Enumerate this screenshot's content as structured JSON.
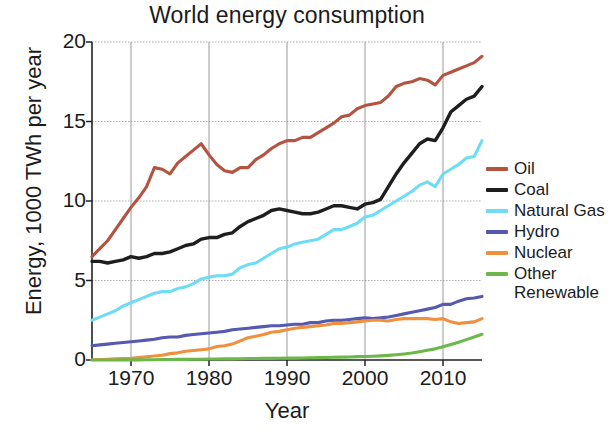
{
  "chart_data": {
    "type": "line",
    "title": "World energy consumption",
    "xlabel": "Year",
    "ylabel": "Energy, 1000 TWh per year",
    "xlim": [
      1965,
      2015
    ],
    "ylim": [
      0,
      20
    ],
    "xticks": [
      1970,
      1980,
      1990,
      2000,
      2010
    ],
    "xtick_labels": [
      "1970",
      "1980",
      "1990",
      "2000",
      "2010"
    ],
    "yticks": [
      0,
      5,
      10,
      15,
      20
    ],
    "ytick_labels": [
      "0",
      "5",
      "10",
      "15",
      "20"
    ],
    "grid": true,
    "legend_position": "right",
    "x": [
      1965,
      1966,
      1967,
      1968,
      1969,
      1970,
      1971,
      1972,
      1973,
      1974,
      1975,
      1976,
      1977,
      1978,
      1979,
      1980,
      1981,
      1982,
      1983,
      1984,
      1985,
      1986,
      1987,
      1988,
      1989,
      1990,
      1991,
      1992,
      1993,
      1994,
      1995,
      1996,
      1997,
      1998,
      1999,
      2000,
      2001,
      2002,
      2003,
      2004,
      2005,
      2006,
      2007,
      2008,
      2009,
      2010,
      2011,
      2012,
      2013,
      2014,
      2015
    ],
    "series": [
      {
        "name": "Oil",
        "color": "#b35340",
        "values": [
          6.5,
          7.0,
          7.5,
          8.2,
          8.9,
          9.6,
          10.2,
          10.9,
          12.1,
          12.0,
          11.7,
          12.4,
          12.8,
          13.2,
          13.6,
          12.9,
          12.3,
          11.9,
          11.8,
          12.1,
          12.1,
          12.6,
          12.9,
          13.3,
          13.6,
          13.8,
          13.8,
          14.0,
          14.0,
          14.3,
          14.6,
          14.9,
          15.3,
          15.4,
          15.8,
          16.0,
          16.1,
          16.2,
          16.6,
          17.2,
          17.4,
          17.5,
          17.7,
          17.6,
          17.3,
          17.9,
          18.1,
          18.3,
          18.5,
          18.7,
          19.1
        ]
      },
      {
        "name": "Coal",
        "color": "#1e1e1e",
        "values": [
          6.2,
          6.2,
          6.1,
          6.2,
          6.3,
          6.5,
          6.4,
          6.5,
          6.7,
          6.7,
          6.8,
          7.0,
          7.2,
          7.3,
          7.6,
          7.7,
          7.7,
          7.9,
          8.0,
          8.4,
          8.7,
          8.9,
          9.1,
          9.4,
          9.5,
          9.4,
          9.3,
          9.2,
          9.2,
          9.3,
          9.5,
          9.7,
          9.7,
          9.6,
          9.5,
          9.8,
          9.9,
          10.1,
          10.9,
          11.7,
          12.4,
          13.0,
          13.6,
          13.9,
          13.8,
          14.6,
          15.6,
          16.0,
          16.4,
          16.6,
          17.2
        ]
      },
      {
        "name": "Natural Gas",
        "color": "#6edcf5",
        "values": [
          2.5,
          2.7,
          2.9,
          3.1,
          3.4,
          3.6,
          3.8,
          4.0,
          4.2,
          4.3,
          4.3,
          4.5,
          4.6,
          4.8,
          5.1,
          5.2,
          5.3,
          5.3,
          5.4,
          5.8,
          6.0,
          6.1,
          6.4,
          6.7,
          7.0,
          7.1,
          7.3,
          7.4,
          7.5,
          7.6,
          7.9,
          8.2,
          8.2,
          8.4,
          8.6,
          9.0,
          9.1,
          9.4,
          9.7,
          10.0,
          10.3,
          10.6,
          11.0,
          11.2,
          10.9,
          11.7,
          12.0,
          12.3,
          12.7,
          12.8,
          13.8
        ]
      },
      {
        "name": "Hydro",
        "color": "#5659b0",
        "values": [
          0.9,
          0.95,
          1.0,
          1.05,
          1.1,
          1.15,
          1.2,
          1.25,
          1.3,
          1.4,
          1.45,
          1.45,
          1.55,
          1.6,
          1.65,
          1.7,
          1.75,
          1.8,
          1.9,
          1.95,
          2.0,
          2.05,
          2.1,
          2.15,
          2.15,
          2.2,
          2.25,
          2.25,
          2.35,
          2.35,
          2.45,
          2.5,
          2.5,
          2.55,
          2.6,
          2.65,
          2.6,
          2.65,
          2.7,
          2.8,
          2.9,
          3.0,
          3.1,
          3.2,
          3.3,
          3.5,
          3.5,
          3.7,
          3.85,
          3.9,
          4.0
        ]
      },
      {
        "name": "Nuclear",
        "color": "#f0903c",
        "values": [
          0.02,
          0.03,
          0.05,
          0.07,
          0.09,
          0.1,
          0.15,
          0.2,
          0.25,
          0.3,
          0.4,
          0.45,
          0.55,
          0.6,
          0.65,
          0.7,
          0.85,
          0.9,
          1.0,
          1.2,
          1.4,
          1.5,
          1.6,
          1.75,
          1.8,
          1.9,
          2.0,
          2.05,
          2.1,
          2.15,
          2.2,
          2.3,
          2.3,
          2.35,
          2.4,
          2.45,
          2.5,
          2.5,
          2.45,
          2.55,
          2.6,
          2.6,
          2.6,
          2.6,
          2.55,
          2.6,
          2.4,
          2.3,
          2.35,
          2.4,
          2.6
        ]
      },
      {
        "name": "Other Renewable",
        "color": "#6cb84a",
        "values": [
          0.0,
          0.0,
          0.0,
          0.0,
          0.01,
          0.01,
          0.01,
          0.02,
          0.02,
          0.03,
          0.03,
          0.04,
          0.04,
          0.05,
          0.05,
          0.06,
          0.06,
          0.07,
          0.07,
          0.08,
          0.09,
          0.09,
          0.1,
          0.1,
          0.11,
          0.12,
          0.12,
          0.13,
          0.14,
          0.15,
          0.16,
          0.17,
          0.18,
          0.19,
          0.21,
          0.22,
          0.24,
          0.26,
          0.29,
          0.33,
          0.38,
          0.44,
          0.52,
          0.61,
          0.7,
          0.83,
          0.97,
          1.12,
          1.28,
          1.45,
          1.62
        ]
      }
    ]
  },
  "legend": {
    "items": [
      {
        "label": "Oil",
        "color": "#b35340"
      },
      {
        "label": "Coal",
        "color": "#1e1e1e"
      },
      {
        "label": "Natural Gas",
        "color": "#6edcf5"
      },
      {
        "label": "Hydro",
        "color": "#5659b0"
      },
      {
        "label": "Nuclear",
        "color": "#f0903c"
      },
      {
        "label": "Other Renewable",
        "color": "#6cb84a"
      }
    ]
  }
}
